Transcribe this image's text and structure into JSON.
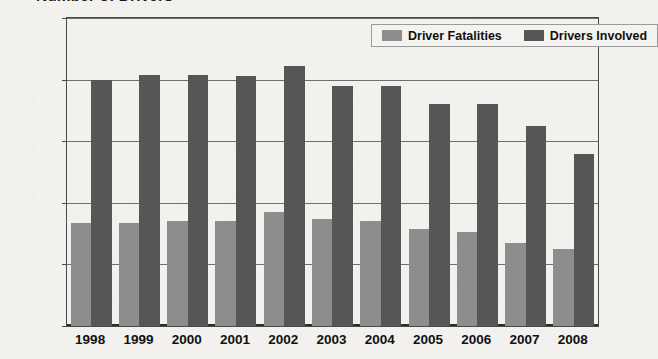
{
  "chart_data": {
    "type": "bar",
    "title": "Number of Drivers",
    "xlabel": "",
    "ylabel": "",
    "categories": [
      "1998",
      "1999",
      "2000",
      "2001",
      "2002",
      "2003",
      "2004",
      "2005",
      "2006",
      "2007",
      "2008"
    ],
    "series": [
      {
        "name": "Driver Fatalities",
        "color": "#8d8d8d",
        "values": [
          3350,
          3350,
          3400,
          3420,
          3700,
          3480,
          3420,
          3150,
          3050,
          2700,
          2500
        ]
      },
      {
        "name": "Drivers Involved",
        "color": "#565656",
        "values": [
          7980,
          8150,
          8150,
          8120,
          8450,
          7800,
          7800,
          7200,
          7200,
          6500,
          5600
        ]
      }
    ],
    "ylim": [
      0,
      10000
    ],
    "yticks": [
      0,
      2000,
      4000,
      6000,
      8000,
      10000
    ],
    "ytick_labels": [
      "0",
      "2000",
      "4000",
      "6000",
      "8000",
      "10000"
    ],
    "grid": true,
    "legend_position": "top-right",
    "legend_entries": [
      "Driver Fatalities",
      "Drivers Involved"
    ]
  },
  "legend": {
    "items": [
      {
        "label": "Driver Fatalities",
        "swatch": "fatalities"
      },
      {
        "label": "Drivers Involved",
        "swatch": "involved"
      }
    ]
  },
  "colors": {
    "fatalities": "#8d8d8d",
    "involved": "#565656",
    "axis": "#4a4a4a",
    "grid": "#6f6f6f",
    "background": "#f2f1ee",
    "text": "#111111"
  }
}
